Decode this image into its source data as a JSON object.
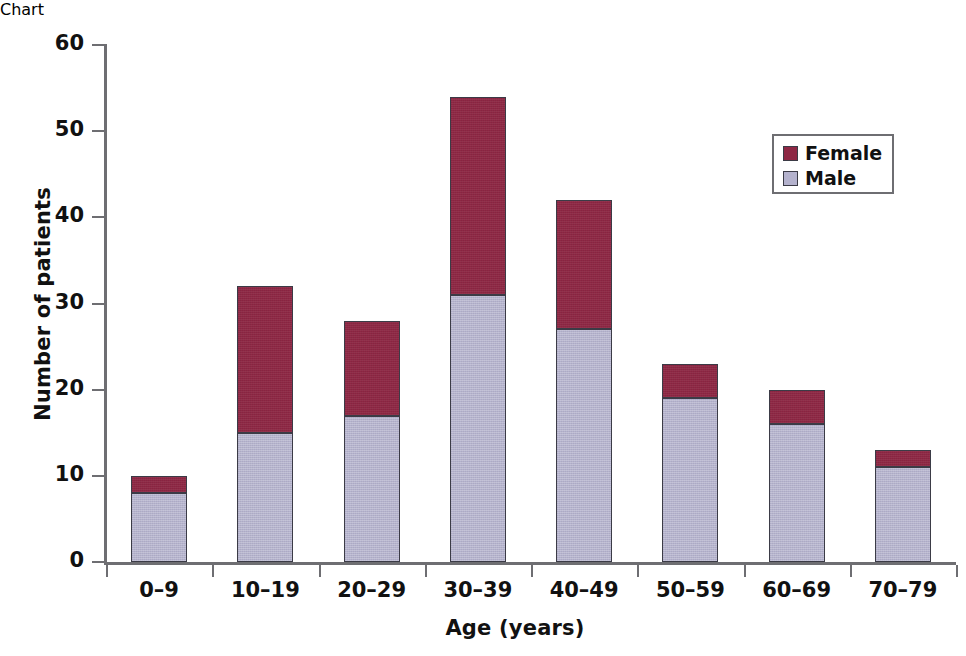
{
  "chart_data": {
    "type": "bar",
    "stacked": true,
    "title": "",
    "xlabel": "Age (years)",
    "ylabel": "Number of patients",
    "categories": [
      "0–9",
      "10–19",
      "20–29",
      "30–39",
      "40–49",
      "50–59",
      "60–69",
      "70–79"
    ],
    "series": [
      {
        "name": "Male",
        "values": [
          8,
          15,
          17,
          31,
          27,
          19,
          16,
          11
        ],
        "color": "#b4b2cd"
      },
      {
        "name": "Female",
        "values": [
          2,
          17,
          11,
          23,
          15,
          4,
          4,
          2
        ],
        "color": "#8e2744"
      }
    ],
    "totals": [
      10,
      32,
      28,
      54,
      42,
      23,
      20,
      13
    ],
    "ylim": [
      0,
      60
    ],
    "yticks": [
      0,
      10,
      20,
      30,
      40,
      50,
      60
    ],
    "ytick_labels": [
      "0",
      "10",
      "20",
      "30",
      "40",
      "50",
      "60"
    ],
    "grid": false,
    "legend_position": "upper right",
    "legend_entries": [
      {
        "label": "Female",
        "color": "#8e2744"
      },
      {
        "label": "Male",
        "color": "#b4b2cd"
      }
    ]
  },
  "axis": {
    "y_label": "Number of patients",
    "x_label": "Age (years)"
  },
  "colors": {
    "female": "#8e2744",
    "male": "#b4b2cd",
    "axis": "#6e6e72",
    "text": "#111111",
    "background": "#ffffff"
  }
}
